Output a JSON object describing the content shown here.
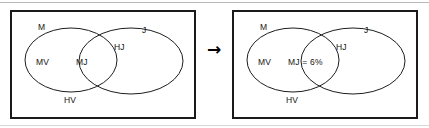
{
  "figure": {
    "type": "venn-diagram-pair",
    "transition_icon": "right-arrow-icon",
    "transition_glyph": "→",
    "stroke_color": "#1d1d1d",
    "border_color": "#1a1a1a",
    "background_color": "#ffffff",
    "panels": [
      {
        "id": "before",
        "name": "venn-diagram-before",
        "sets": [
          {
            "id": "m",
            "label": "M"
          },
          {
            "id": "j",
            "label": "J"
          }
        ],
        "regions": [
          {
            "id": "mv",
            "label": "MV"
          },
          {
            "id": "mj",
            "label": "MJ"
          },
          {
            "id": "hj",
            "label": "HJ"
          },
          {
            "id": "hv",
            "label": "HV"
          }
        ]
      },
      {
        "id": "after",
        "name": "venn-diagram-after",
        "sets": [
          {
            "id": "m",
            "label": "M"
          },
          {
            "id": "j",
            "label": "J"
          }
        ],
        "regions": [
          {
            "id": "mv",
            "label": "MV"
          },
          {
            "id": "mj",
            "label": "MJ = 6%"
          },
          {
            "id": "hj",
            "label": "HJ"
          },
          {
            "id": "hv",
            "label": "HV"
          }
        ]
      }
    ]
  }
}
